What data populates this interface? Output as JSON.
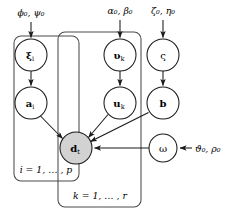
{
  "diagram": {
    "type": "bayesian-network-plate-diagram",
    "background_color": "#ffffff",
    "stroke_color": "#1a1a1a",
    "plate_stroke_color": "#4a4a4a",
    "observed_node_fill": "#d2d2d2",
    "latent_node_fill": "#ffffff",
    "nodes": [
      {
        "id": "xi",
        "label": "ξ",
        "subscript": "i",
        "bold": true,
        "observed": false,
        "cx": 31,
        "cy": 55,
        "r": 16
      },
      {
        "id": "a",
        "label": "a",
        "subscript": "i",
        "bold": true,
        "observed": false,
        "cx": 31,
        "cy": 103,
        "r": 16
      },
      {
        "id": "upsilon",
        "label": "υ",
        "subscript": "k",
        "bold": true,
        "observed": false,
        "cx": 120,
        "cy": 55,
        "r": 16
      },
      {
        "id": "u",
        "label": "u",
        "subscript": "k",
        "bold": true,
        "observed": false,
        "cx": 120,
        "cy": 103,
        "r": 16
      },
      {
        "id": "varsigma",
        "label": "ς",
        "subscript": "",
        "bold": false,
        "observed": false,
        "cx": 163,
        "cy": 55,
        "r": 16
      },
      {
        "id": "b",
        "label": "b",
        "subscript": "",
        "bold": true,
        "observed": false,
        "cx": 163,
        "cy": 103,
        "r": 16
      },
      {
        "id": "d",
        "label": "d",
        "subscript": "t",
        "bold": true,
        "observed": true,
        "cx": 76,
        "cy": 148,
        "r": 16
      },
      {
        "id": "omega",
        "label": "ω",
        "subscript": "",
        "bold": false,
        "observed": false,
        "cx": 163,
        "cy": 148,
        "r": 14
      }
    ],
    "hyperparameters": [
      {
        "id": "phi-psi",
        "text": "ϕ₀, ψ₀",
        "greek": [
          "ϕ",
          "ψ"
        ],
        "x": 31,
        "y": 16,
        "target": "xi"
      },
      {
        "id": "alpha-beta",
        "text": "α₀, β₀",
        "greek": [
          "α",
          "β"
        ],
        "x": 120,
        "y": 14,
        "target": "upsilon"
      },
      {
        "id": "zeta-eta",
        "text": "ζ₀, η₀",
        "greek": [
          "ζ",
          "η"
        ],
        "x": 163,
        "y": 14,
        "target": "varsigma"
      },
      {
        "id": "theta-rho",
        "text": "ϑ₀, ρ₀",
        "greek": [
          "ϑ",
          "ρ"
        ],
        "x": 200,
        "y": 152,
        "target": "omega"
      }
    ],
    "plates": [
      {
        "id": "plate-i",
        "label": "i = 1, … , p",
        "x": 14,
        "y": 36,
        "width": 65,
        "height": 145,
        "rx": 7,
        "label_x": 46,
        "label_y": 173
      },
      {
        "id": "plate-k",
        "label": "k = 1, … , r",
        "x": 58,
        "y": 32,
        "width": 83,
        "height": 175,
        "rx": 7,
        "label_x": 100,
        "label_y": 199
      }
    ],
    "edges": [
      {
        "id": "edge-xi-a",
        "from": "xi",
        "to": "a"
      },
      {
        "id": "edge-a-d",
        "from": "a",
        "to": "d"
      },
      {
        "id": "edge-upsilon-u",
        "from": "upsilon",
        "to": "u"
      },
      {
        "id": "edge-u-d",
        "from": "u",
        "to": "d"
      },
      {
        "id": "edge-varsigma-b",
        "from": "varsigma",
        "to": "b"
      },
      {
        "id": "edge-b-d",
        "from": "b",
        "to": "d"
      },
      {
        "id": "edge-omega-d",
        "from": "omega",
        "to": "d"
      }
    ]
  }
}
